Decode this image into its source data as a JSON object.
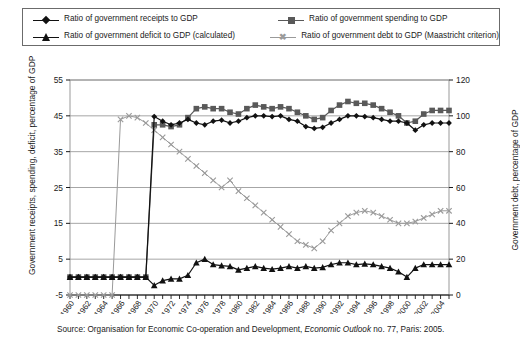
{
  "legend": {
    "items": [
      {
        "label": "Ratio of government receipts to GDP",
        "marker": "diamond-marker",
        "color": "#111111"
      },
      {
        "label": "Ratio of government spending to GDP",
        "marker": "square-marker",
        "color": "#595959"
      },
      {
        "label": "Ratio of government deficit to GDP (calculated)",
        "marker": "triangle-marker",
        "color": "#111111"
      },
      {
        "label": "Ratio of government debt to GDP (Maastricht criterion)",
        "marker": "x-marker",
        "color": "#9a9a9a"
      }
    ]
  },
  "axes": {
    "left_title": "Government receipts, spending, deficit, percentage of GDP",
    "right_title": "Government debt, percentage of GDP",
    "left_ticks": [
      "-5",
      "5",
      "15",
      "25",
      "35",
      "45",
      "55"
    ],
    "right_ticks": [
      "0",
      "20",
      "40",
      "60",
      "80",
      "100",
      "120"
    ],
    "x_ticks": [
      "1960",
      "1962",
      "1964",
      "1966",
      "1968",
      "1970",
      "1972",
      "1974",
      "1976",
      "1978",
      "1980",
      "1982",
      "1984",
      "1986",
      "1988",
      "1990",
      "1992",
      "1994",
      "1996",
      "1998",
      "2000",
      "2002",
      "2004"
    ]
  },
  "source": {
    "prefix": "Source: Organisation for Economic Co-operation and Development, ",
    "italic": "Economic Outlook",
    "suffix": " no. 77, Paris: 2005."
  },
  "chart_data": {
    "type": "line",
    "title": "",
    "xlabel": "",
    "ylabel": "Government receipts, spending, deficit, percentage of GDP",
    "ylabel_right": "Government debt, percentage of GDP",
    "ylim": [
      -5,
      55
    ],
    "ylim_right": [
      0,
      120
    ],
    "xlim": [
      1960,
      2005
    ],
    "grid": true,
    "legend_position": "top",
    "x": [
      1960,
      1961,
      1962,
      1963,
      1964,
      1965,
      1966,
      1967,
      1968,
      1969,
      1970,
      1971,
      1972,
      1973,
      1974,
      1975,
      1976,
      1977,
      1978,
      1979,
      1980,
      1981,
      1982,
      1983,
      1984,
      1985,
      1986,
      1987,
      1988,
      1989,
      1990,
      1991,
      1992,
      1993,
      1994,
      1995,
      1996,
      1997,
      1998,
      1999,
      2000,
      2001,
      2002,
      2003,
      2004,
      2005
    ],
    "series": [
      {
        "name": "Ratio of government receipts to GDP",
        "marker": "diamond",
        "color": "#111111",
        "axis": "left",
        "values": [
          0,
          0,
          0,
          0,
          0,
          0,
          0,
          0,
          0,
          0,
          44.8,
          43.5,
          42.5,
          43.0,
          44.0,
          43.0,
          42.5,
          43.5,
          43.8,
          43.0,
          43.5,
          44.5,
          45.0,
          45.0,
          44.8,
          45.0,
          44.0,
          43.5,
          42.0,
          41.5,
          41.8,
          43.0,
          44.0,
          45.0,
          45.0,
          44.8,
          44.5,
          44.0,
          43.5,
          43.5,
          43.0,
          41.0,
          42.5,
          43.0,
          43.0,
          43.0
        ]
      },
      {
        "name": "Ratio of government spending to GDP",
        "marker": "square",
        "color": "#595959",
        "axis": "left",
        "values": [
          0,
          0,
          0,
          0,
          0,
          0,
          0,
          0,
          0,
          0,
          42.5,
          42.5,
          42.0,
          42.5,
          44.5,
          47.0,
          47.5,
          47.0,
          47.0,
          46.0,
          45.5,
          47.0,
          48.0,
          47.5,
          47.0,
          47.5,
          47.0,
          46.0,
          45.0,
          44.0,
          44.5,
          46.5,
          48.0,
          49.0,
          48.5,
          48.5,
          48.0,
          47.0,
          46.0,
          45.0,
          43.0,
          43.5,
          45.5,
          46.5,
          46.5,
          46.5
        ]
      },
      {
        "name": "Ratio of government deficit to GDP (calculated)",
        "marker": "triangle",
        "color": "#111111",
        "axis": "left",
        "values": [
          0,
          0,
          0,
          0,
          0,
          0,
          0,
          0,
          0,
          0,
          -2.3,
          -1.0,
          -0.5,
          -0.5,
          0.5,
          4.0,
          5.0,
          3.5,
          3.2,
          3.0,
          2.0,
          2.5,
          3.0,
          2.5,
          2.2,
          2.5,
          3.0,
          2.5,
          3.0,
          2.5,
          2.7,
          3.5,
          4.0,
          4.0,
          3.5,
          3.7,
          3.5,
          3.0,
          2.5,
          1.5,
          0.0,
          2.5,
          3.5,
          3.5,
          3.5,
          3.5
        ]
      },
      {
        "name": "Ratio of government debt to GDP (Maastricht criterion)",
        "marker": "x",
        "color": "#9a9a9a",
        "axis": "right",
        "values": [
          0,
          0,
          0,
          0,
          0,
          0,
          98,
          100,
          99,
          96,
          92,
          88,
          84,
          80,
          76,
          72,
          68,
          64,
          60,
          64,
          58,
          54,
          50,
          46,
          42,
          38,
          34,
          30,
          28,
          26,
          30,
          36,
          40,
          44,
          46,
          47,
          46,
          44,
          42,
          40,
          40,
          41,
          43,
          45,
          47,
          47
        ]
      }
    ]
  }
}
